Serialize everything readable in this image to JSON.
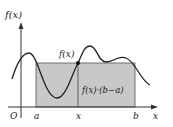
{
  "diagram": {
    "y_axis_label": "f(x)",
    "x_axis_label": "x",
    "origin_label": "O",
    "point_a_label": "a",
    "point_x_label": "x",
    "point_b_label": "b",
    "point_value_label": "f(x)",
    "rectangle_label": "f(x)·(b−a)",
    "colors": {
      "rectangle_fill": "#c8c8c8",
      "curve": "#222222",
      "axes": "#333333"
    }
  }
}
